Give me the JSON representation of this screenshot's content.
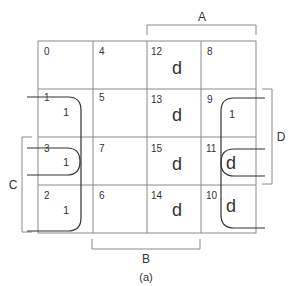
{
  "kmap": {
    "caption": "(a)",
    "variables": {
      "A": "A",
      "B": "B",
      "C": "C",
      "D": "D"
    },
    "cells": [
      [
        {
          "index": "0",
          "value": ""
        },
        {
          "index": "4",
          "value": ""
        },
        {
          "index": "12",
          "value": "d"
        },
        {
          "index": "8",
          "value": ""
        }
      ],
      [
        {
          "index": "1",
          "value": "1"
        },
        {
          "index": "5",
          "value": ""
        },
        {
          "index": "13",
          "value": "d"
        },
        {
          "index": "9",
          "value": "1"
        }
      ],
      [
        {
          "index": "3",
          "value": "1"
        },
        {
          "index": "7",
          "value": ""
        },
        {
          "index": "15",
          "value": "d"
        },
        {
          "index": "11",
          "value": "d"
        }
      ],
      [
        {
          "index": "2",
          "value": "1"
        },
        {
          "index": "6",
          "value": ""
        },
        {
          "index": "14",
          "value": "d"
        },
        {
          "index": "10",
          "value": "d"
        }
      ]
    ]
  }
}
